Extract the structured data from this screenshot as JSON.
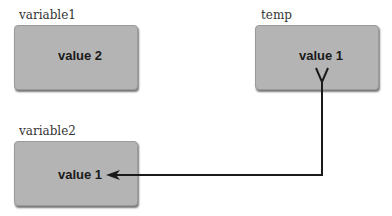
{
  "variables": [
    {
      "name": "variable1",
      "value": "value 2"
    },
    {
      "name": "temp",
      "value": "value 1"
    },
    {
      "name": "variable2",
      "value": "value 1"
    }
  ],
  "arrow": {
    "from": "temp",
    "to": "variable2",
    "color": "#1a1a1a"
  },
  "colors": {
    "box": "#b4b4b4",
    "background": "#ffffff"
  }
}
